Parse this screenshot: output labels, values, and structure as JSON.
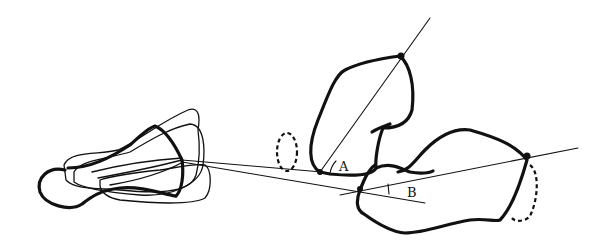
{
  "figure": {
    "labels": {
      "angle_a": "A",
      "angle_b": "B"
    },
    "ink_color": "#111111",
    "background_color": "#ffffff"
  }
}
